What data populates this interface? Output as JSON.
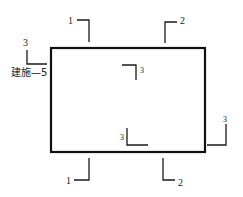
{
  "diagram": {
    "type": "section-cut-plan",
    "outline": {
      "x": 51,
      "y": 48,
      "width": 154,
      "height": 104
    },
    "reference_note": {
      "number": "3",
      "sheet": "建施—5"
    },
    "section_markers": [
      {
        "id": "top-1",
        "label": "1"
      },
      {
        "id": "top-2",
        "label": "2"
      },
      {
        "id": "inner-top-3",
        "label": "3"
      },
      {
        "id": "inner-bottom-3",
        "label": "3"
      },
      {
        "id": "right-3",
        "label": "3"
      },
      {
        "id": "bottom-1",
        "label": "1"
      },
      {
        "id": "bottom-2",
        "label": "2"
      }
    ]
  }
}
